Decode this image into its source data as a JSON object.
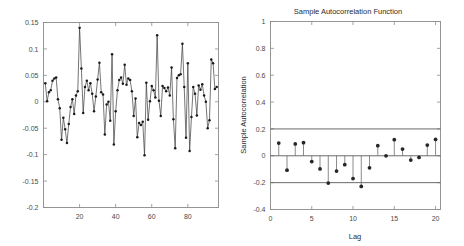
{
  "figure": {
    "background": "#ffffff",
    "line_color": "#3a3a3a",
    "marker_color": "#1a1a1a",
    "axis_color": "#8c8c8c",
    "bound_color": "#5a5a5a"
  },
  "chart_data": [
    {
      "id": "residual-series",
      "type": "line",
      "title": "",
      "xlabel": "",
      "ylabel": "",
      "xlim": [
        0,
        97
      ],
      "ylim": [
        -0.2,
        0.15
      ],
      "xticks": [
        20,
        40,
        60,
        80
      ],
      "xticklabels": [
        "20",
        "40",
        "60",
        "80"
      ],
      "yticks": [
        -0.2,
        -0.15,
        -0.1,
        -0.05,
        0,
        0.05,
        0.1,
        0.15
      ],
      "yticklabels": [
        "-0.2",
        "-0.15",
        "-0.1",
        "-0.05",
        "0",
        "0.05",
        "0.1",
        "0.15"
      ],
      "grid": false,
      "legend": "none",
      "markers": "filled-circle",
      "x": [
        1,
        2,
        3,
        4,
        5,
        6,
        7,
        8,
        9,
        10,
        11,
        12,
        13,
        14,
        15,
        16,
        17,
        18,
        19,
        20,
        21,
        22,
        23,
        24,
        25,
        26,
        27,
        28,
        29,
        30,
        31,
        32,
        33,
        34,
        35,
        36,
        37,
        38,
        39,
        40,
        41,
        42,
        43,
        44,
        45,
        46,
        47,
        48,
        49,
        50,
        51,
        52,
        53,
        54,
        55,
        56,
        57,
        58,
        59,
        60,
        61,
        62,
        63,
        64,
        65,
        66,
        67,
        68,
        69,
        70,
        71,
        72,
        73,
        74,
        75,
        76,
        77,
        78,
        79,
        80,
        81,
        82,
        83,
        84,
        85,
        86,
        87,
        88,
        89,
        90,
        91,
        92,
        93,
        94,
        95,
        96
      ],
      "values": [
        0.035,
        0.001,
        0.018,
        0.022,
        0.04,
        0.044,
        0.046,
        0.005,
        -0.012,
        -0.072,
        -0.03,
        -0.052,
        -0.078,
        -0.042,
        -0.01,
        0.005,
        -0.023,
        0.012,
        0.02,
        0.14,
        0.063,
        -0.021,
        0.028,
        0.04,
        0.022,
        0.035,
        0.015,
        -0.018,
        0.01,
        0.042,
        0.074,
        0.018,
        0.014,
        -0.062,
        -0.005,
        0.0,
        -0.036,
        0.09,
        -0.081,
        -0.018,
        0.022,
        0.041,
        0.046,
        0.034,
        0.07,
        0.032,
        0.044,
        0.041,
        0.02,
        -0.027,
        0.006,
        -0.067,
        -0.04,
        -0.044,
        -0.038,
        -0.101,
        0.036,
        -0.034,
        0.001,
        0.03,
        0.022,
        0.008,
        0.126,
        0.002,
        -0.027,
        0.03,
        0.026,
        0.02,
        0.027,
        0.012,
        0.065,
        -0.033,
        -0.088,
        0.045,
        0.05,
        0.052,
        0.11,
        0.028,
        -0.068,
        0.073,
        -0.093,
        -0.029,
        0.028,
        0.015,
        -0.026,
        0.031,
        0.023,
        0.033,
        0.012,
        0.0,
        -0.05,
        -0.035,
        0.08,
        0.073,
        0.024,
        0.028
      ]
    },
    {
      "id": "sample-autocorrelation",
      "type": "bar",
      "title": "Sample Autocorrelation Function",
      "xlabel": "Lag",
      "ylabel": "Sample Autocorrelation",
      "xlim": [
        0,
        20.6
      ],
      "ylim": [
        -0.4,
        1.0
      ],
      "xticks": [
        0,
        5,
        10,
        15,
        20
      ],
      "xticklabels": [
        "0",
        "5",
        "10",
        "15",
        "20"
      ],
      "yticks": [
        -0.4,
        -0.2,
        0,
        0.2,
        0.4,
        0.6,
        0.8,
        1.0
      ],
      "yticklabels": [
        "-0.4",
        "-0.2",
        "0",
        "0.2",
        "0.4",
        "0.6",
        "0.8",
        "1"
      ],
      "grid": false,
      "legend": "none",
      "markers": "filled-circle",
      "confidence_bounds": [
        0.2,
        -0.2
      ],
      "categories": [
        1,
        2,
        3,
        4,
        5,
        6,
        7,
        8,
        9,
        10,
        11,
        12,
        13,
        14,
        15,
        16,
        17,
        18,
        19,
        20
      ],
      "values": [
        0.095,
        -0.107,
        0.088,
        0.098,
        -0.043,
        -0.098,
        -0.203,
        -0.114,
        -0.066,
        -0.17,
        -0.228,
        -0.09,
        0.075,
        0.0,
        0.12,
        0.05,
        -0.032,
        -0.012,
        0.08,
        0.122
      ]
    }
  ]
}
